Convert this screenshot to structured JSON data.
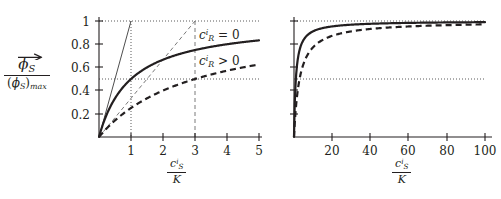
{
  "figure": {
    "background": "#ffffff",
    "ink_color": "#231f20",
    "panel_count": 2
  },
  "labels": {
    "ylabel_numerator_symbol": "ϕ",
    "ylabel_numerator_sub": "S",
    "ylabel_denominator_open": "(",
    "ylabel_denominator_symbol": "ϕ",
    "ylabel_denominator_sub": "S",
    "ylabel_denominator_close": ")",
    "ylabel_denominator_max": "max",
    "xlabel_numerator_symbol": "c",
    "xlabel_numerator_sub": "S",
    "xlabel_numerator_sup": "i",
    "xlabel_denominator": "K",
    "series_solid_label_symbol": "c",
    "series_solid_label_sub": "R",
    "series_solid_label_sup": "i",
    "series_solid_label_rel": "= 0",
    "series_dashed_label_symbol": "c",
    "series_dashed_label_sub": "R",
    "series_dashed_label_sup": "i",
    "series_dashed_label_rel": "> 0"
  },
  "chart_data": [
    {
      "type": "line",
      "panel": "left",
      "title": "",
      "xlabel": "c_S^i / K",
      "ylabel": "phi_S_vector / (phi_S)_max",
      "xlim": [
        0,
        5
      ],
      "ylim": [
        0,
        1.03
      ],
      "grid": false,
      "legend_position": "inside-right",
      "xticks": [
        1,
        2,
        3,
        4,
        5
      ],
      "xtick_labels": [
        "1",
        "2",
        "3",
        "4",
        "5"
      ],
      "yticks": [
        0.2,
        0.4,
        0.6,
        0.8,
        1
      ],
      "ytick_labels": [
        "0.2",
        "0.4",
        "0.6",
        "0.8",
        "1"
      ],
      "guides": [
        {
          "name": "dotted-horizontal-1.0",
          "kind": "dotted-horizontal",
          "y": 1.0,
          "x_from": 0,
          "x_to": 5
        },
        {
          "name": "dotted-horizontal-0.5",
          "kind": "dotted-horizontal",
          "y": 0.5,
          "x_from": 0,
          "x_to": 5
        },
        {
          "name": "dotted-vertical-x1",
          "kind": "dotted-vertical",
          "x": 1,
          "y_from": 0,
          "y_to": 1.0
        },
        {
          "name": "dashed-vertical-x3",
          "kind": "dashed-vertical",
          "x": 3,
          "y_from": 0,
          "y_to": 1.0
        },
        {
          "name": "initial-slope-solid",
          "kind": "thin-straight",
          "points": [
            [
              0,
              0
            ],
            [
              1,
              1
            ]
          ]
        },
        {
          "name": "initial-slope-dashed",
          "kind": "thin-dashed-straight",
          "points": [
            [
              0,
              0
            ],
            [
              3,
              1
            ]
          ]
        }
      ],
      "series": [
        {
          "name": "c_R^i = 0",
          "style": "solid",
          "half_saturation_x": 1,
          "x": [
            0,
            0.1,
            0.2,
            0.3,
            0.4,
            0.5,
            0.6,
            0.8,
            1.0,
            1.25,
            1.5,
            1.75,
            2.0,
            2.5,
            3.0,
            3.5,
            4.0,
            4.5,
            5.0
          ],
          "values": [
            0,
            0.091,
            0.167,
            0.231,
            0.286,
            0.333,
            0.375,
            0.444,
            0.5,
            0.556,
            0.6,
            0.636,
            0.667,
            0.714,
            0.75,
            0.778,
            0.8,
            0.818,
            0.833
          ]
        },
        {
          "name": "c_R^i > 0",
          "style": "dashed",
          "half_saturation_x": 3,
          "x": [
            0,
            0.1,
            0.2,
            0.3,
            0.5,
            0.75,
            1.0,
            1.5,
            2.0,
            2.5,
            3.0,
            3.5,
            4.0,
            4.5,
            5.0
          ],
          "values": [
            0,
            0.032,
            0.063,
            0.091,
            0.143,
            0.2,
            0.25,
            0.333,
            0.4,
            0.455,
            0.5,
            0.538,
            0.571,
            0.6,
            0.625
          ]
        }
      ]
    },
    {
      "type": "line",
      "panel": "right",
      "title": "",
      "xlabel": "c_S^i / K",
      "ylabel": "",
      "xlim": [
        0,
        103
      ],
      "ylim": [
        0,
        1.03
      ],
      "grid": false,
      "legend_position": "none",
      "xticks": [
        20,
        40,
        60,
        80,
        100
      ],
      "xtick_labels": [
        "20",
        "40",
        "60",
        "80",
        "100"
      ],
      "yticks": [
        0.2,
        0.4,
        0.6,
        0.8,
        1
      ],
      "ytick_labels": [
        "",
        "",
        "",
        "",
        ""
      ],
      "guides": [
        {
          "name": "dotted-horizontal-1.0",
          "kind": "dotted-horizontal",
          "y": 1.0,
          "x_from": 0,
          "x_to": 103
        },
        {
          "name": "dotted-horizontal-0.5",
          "kind": "dotted-horizontal",
          "y": 0.5,
          "x_from": 0,
          "x_to": 103
        }
      ],
      "series": [
        {
          "name": "c_R^i = 0",
          "style": "solid",
          "half_saturation_x": 1,
          "x": [
            0,
            0.5,
            1,
            2,
            3,
            5,
            7,
            10,
            15,
            20,
            30,
            40,
            50,
            60,
            70,
            80,
            90,
            100
          ],
          "values": [
            0,
            0.333,
            0.5,
            0.667,
            0.75,
            0.833,
            0.875,
            0.909,
            0.938,
            0.952,
            0.968,
            0.976,
            0.98,
            0.984,
            0.986,
            0.988,
            0.989,
            0.99
          ]
        },
        {
          "name": "c_R^i > 0",
          "style": "dashed",
          "half_saturation_x": 3,
          "x": [
            0,
            0.5,
            1,
            2,
            3,
            5,
            7,
            10,
            15,
            20,
            30,
            40,
            50,
            60,
            70,
            80,
            90,
            100
          ],
          "values": [
            0,
            0.143,
            0.25,
            0.4,
            0.5,
            0.625,
            0.7,
            0.769,
            0.833,
            0.87,
            0.909,
            0.93,
            0.943,
            0.952,
            0.959,
            0.964,
            0.968,
            0.971
          ]
        }
      ]
    }
  ]
}
